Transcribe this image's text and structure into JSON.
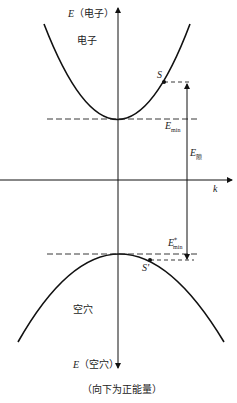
{
  "diagram": {
    "type": "band-structure",
    "axis_top_label": {
      "symbol": "E",
      "text": "（电子）"
    },
    "axis_bottom_label": {
      "symbol": "E",
      "text": "（空穴）"
    },
    "k_axis_label": "k",
    "electron_band_label": "电子",
    "hole_band_label": "空穴",
    "point_s": "S",
    "point_s_prime": "S'",
    "e_min": {
      "symbol": "E",
      "sub": "min"
    },
    "e_min_hole": {
      "symbol": "E",
      "sup": "*",
      "sub": "min"
    },
    "e_gap": {
      "symbol": "E",
      "sub": "隙"
    },
    "caption": "（向下为正能量）"
  }
}
